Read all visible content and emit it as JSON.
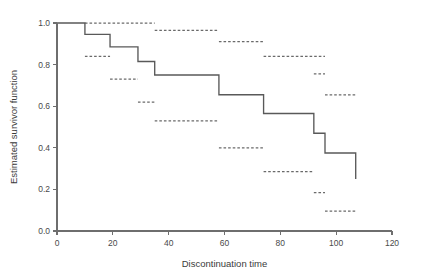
{
  "chart_data": {
    "type": "line",
    "title": "",
    "subtitle": "",
    "xlabel": "Discontinuation time",
    "ylabel": "Estimated survivor function",
    "xlim": [
      0,
      120
    ],
    "ylim": [
      0.0,
      1.0
    ],
    "xticks": [
      0,
      20,
      40,
      60,
      80,
      100,
      120
    ],
    "xtick_labels": [
      "0",
      "20",
      "40",
      "60",
      "80",
      "100",
      "120"
    ],
    "yticks": [
      0.0,
      0.2,
      0.4,
      0.6,
      0.8,
      1.0
    ],
    "ytick_labels": [
      "0.0",
      "0.2",
      "0.4",
      "0.6",
      "0.8",
      "1.0"
    ],
    "grid": false,
    "legend": null,
    "legend_position": "none",
    "step_style": "post",
    "series": [
      {
        "name": "Estimated survivor function",
        "style": "solid",
        "color": "#595959",
        "x": [
          0,
          10,
          19,
          29,
          35,
          58,
          74,
          92,
          96,
          106,
          107
        ],
        "y": [
          1.0,
          0.945,
          0.885,
          0.815,
          0.75,
          0.655,
          0.565,
          0.47,
          0.375,
          0.375,
          0.25
        ]
      }
    ],
    "confidence_band_style": "dashed",
    "confidence_band_color": "#6a6a6a",
    "confidence_bands": [
      {
        "bound": "upper",
        "x_start": 10,
        "x_end": 35,
        "y": 1.0
      },
      {
        "bound": "upper",
        "x_start": 35,
        "x_end": 58,
        "y": 0.965
      },
      {
        "bound": "upper",
        "x_start": 58,
        "x_end": 74,
        "y": 0.91
      },
      {
        "bound": "upper",
        "x_start": 74,
        "x_end": 96,
        "y": 0.84
      },
      {
        "bound": "upper",
        "x_start": 92,
        "x_end": 96,
        "y": 0.755
      },
      {
        "bound": "upper",
        "x_start": 96,
        "x_end": 107,
        "y": 0.655
      },
      {
        "bound": "lower",
        "x_start": 10,
        "x_end": 19,
        "y": 0.84
      },
      {
        "bound": "lower",
        "x_start": 19,
        "x_end": 29,
        "y": 0.73
      },
      {
        "bound": "lower",
        "x_start": 29,
        "x_end": 35,
        "y": 0.62
      },
      {
        "bound": "lower",
        "x_start": 35,
        "x_end": 58,
        "y": 0.53
      },
      {
        "bound": "lower",
        "x_start": 58,
        "x_end": 74,
        "y": 0.4
      },
      {
        "bound": "lower",
        "x_start": 74,
        "x_end": 92,
        "y": 0.285
      },
      {
        "bound": "lower",
        "x_start": 92,
        "x_end": 96,
        "y": 0.185
      },
      {
        "bound": "lower",
        "x_start": 96,
        "x_end": 107,
        "y": 0.095
      }
    ]
  },
  "axes": {
    "x_title": "Discontinuation time",
    "y_title": "Estimated survivor function"
  },
  "colors": {
    "curve": "#595959",
    "band": "#6a6a6a",
    "axis": "#6e6e6e",
    "text": "#3a3a3a",
    "background": "#ffffff"
  }
}
